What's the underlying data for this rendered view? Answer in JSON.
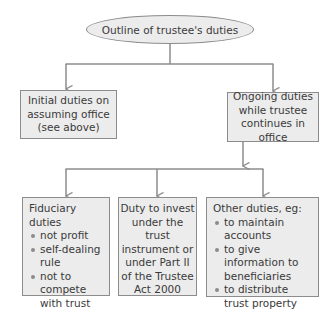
{
  "diagram": {
    "root": {
      "label": "Outline of trustee's duties"
    },
    "level1": [
      {
        "lines": [
          "Initial duties on",
          "assuming office",
          "(see above)"
        ]
      },
      {
        "lines": [
          "Ongoing duties",
          "while trustee",
          "continues in office"
        ]
      }
    ],
    "level2": [
      {
        "heading": "Fiduciary duties",
        "items": [
          "not profit",
          "self-dealing rule",
          "not to compete with trust"
        ]
      },
      {
        "lines": [
          "Duty to invest",
          "under the trust",
          "instrument or",
          "under Part II",
          "of the Trustee",
          "Act 2000"
        ]
      },
      {
        "heading": "Other duties, eg:",
        "items": [
          "to maintain accounts",
          "to give information to beneficiaries",
          "to distribute trust property"
        ]
      }
    ],
    "colors": {
      "box_fill": "#ececec",
      "line": "#8c8c8c",
      "text": "#3a3a3a"
    }
  }
}
